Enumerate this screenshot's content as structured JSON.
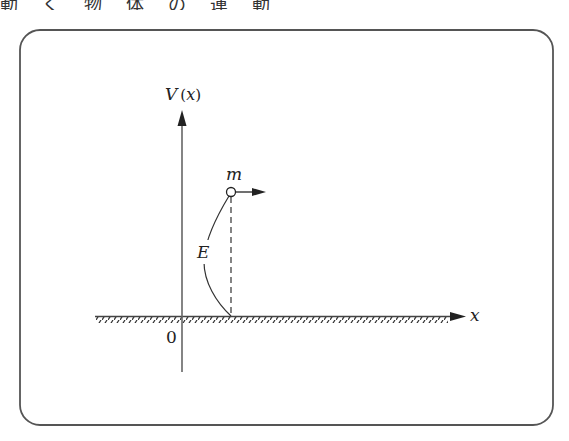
{
  "top_strip": {
    "text": "動く物体の運動"
  },
  "diagram": {
    "frame": {
      "stroke": "#555555",
      "corner_radius": 20
    },
    "y_axis_label": "V (x)",
    "x_axis_label": "x",
    "origin_label": "0",
    "mass_label": "m",
    "energy_label": "E",
    "line_color": "#222222",
    "axis_color": "#555555"
  }
}
